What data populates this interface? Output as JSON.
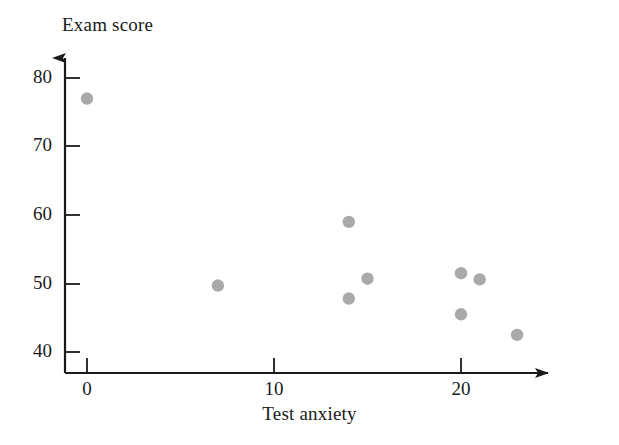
{
  "chart_data": {
    "type": "scatter",
    "title": "",
    "xlabel": "Test anxiety",
    "ylabel": "Exam score",
    "xlim": [
      -1.5,
      26
    ],
    "ylim": [
      38,
      82
    ],
    "xticks": [
      0,
      10,
      20
    ],
    "xtick_labels": [
      "0",
      "10",
      "20"
    ],
    "yticks": [
      40,
      50,
      60,
      70,
      80
    ],
    "ytick_labels": [
      "40",
      "50",
      "60",
      "70",
      "80"
    ],
    "grid": false,
    "legend": null,
    "marker_color": "#a9a9a9",
    "axis_color": "#1a1a1a",
    "points": [
      {
        "x": 0,
        "y": 77
      },
      {
        "x": 7,
        "y": 49.7
      },
      {
        "x": 14,
        "y": 59
      },
      {
        "x": 14,
        "y": 47.8
      },
      {
        "x": 15,
        "y": 50.7
      },
      {
        "x": 20,
        "y": 51.5
      },
      {
        "x": 20,
        "y": 45.5
      },
      {
        "x": 21,
        "y": 50.6
      },
      {
        "x": 23,
        "y": 42.5
      }
    ]
  }
}
